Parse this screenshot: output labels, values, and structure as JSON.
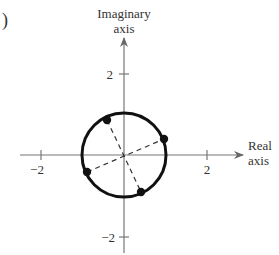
{
  "figure": {
    "panel_label": ")",
    "axes": {
      "vertical_label_line1": "Imaginary",
      "vertical_label_line2": "axis",
      "horizontal_label_line1": "Real",
      "horizontal_label_line2": "axis",
      "ticks": {
        "x_neg": "−2",
        "x_pos": "2",
        "y_pos": "2",
        "y_neg": "−2"
      }
    },
    "circle": {
      "center": [
        0,
        0
      ],
      "radius": 1
    },
    "points": [
      {
        "name": "point-upper-left",
        "angle_deg": 112.5
      },
      {
        "name": "point-right",
        "angle_deg": 22.5
      },
      {
        "name": "point-lower-left",
        "angle_deg": 202.5
      },
      {
        "name": "point-bottom",
        "angle_deg": 292.5
      }
    ],
    "colors": {
      "axis": "#777777",
      "circle": "#111111",
      "dashed": "#333333",
      "text": "#333333"
    }
  }
}
